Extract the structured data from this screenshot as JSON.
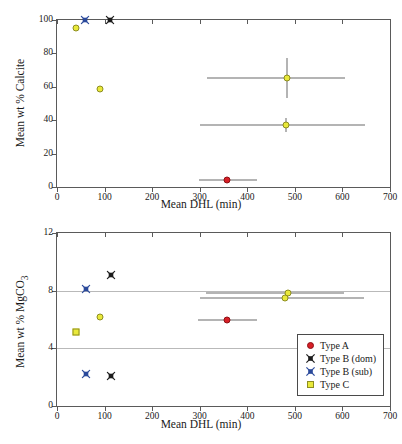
{
  "figure": {
    "panels": [
      "calcite-panel",
      "mgco3-panel"
    ]
  },
  "chart_data": [
    {
      "id": "calcite",
      "type": "scatter",
      "title": "",
      "xlabel": "Mean DHL (min)",
      "ylabel": "Mean wt % Calcite",
      "xlim": [
        0,
        700
      ],
      "ylim": [
        0,
        100
      ],
      "xticks": [
        0,
        100,
        200,
        300,
        400,
        500,
        600,
        700
      ],
      "yticks": [
        0,
        20,
        40,
        60,
        80,
        100
      ],
      "xticklabels": [
        "0",
        "100",
        "200",
        "300",
        "400",
        "500",
        "600",
        "700"
      ],
      "yticklabels": [
        "0",
        "20",
        "40",
        "60",
        "80",
        "100"
      ],
      "grid": false,
      "frame": "box",
      "legend": null,
      "series": [
        {
          "name": "Type A",
          "marker": "circle",
          "color": "#d81f26",
          "points": [
            {
              "x": 358,
              "y": 4.0,
              "xerr_low": 298,
              "xerr_high": 420
            }
          ]
        },
        {
          "name": "Type B (dom)",
          "marker": "x-dark",
          "color": "#1c1c1c",
          "points": [
            {
              "x": 112,
              "y": 100.0
            }
          ]
        },
        {
          "name": "Type B (sub)",
          "marker": "x-blue",
          "color": "#2b4a9b",
          "points": [
            {
              "x": 58,
              "y": 100.0
            }
          ]
        },
        {
          "name": "Type C",
          "marker": "circle",
          "color": "#e9e93a",
          "points": [
            {
              "x": 40,
              "y": 95.2
            },
            {
              "x": 90,
              "y": 58.4
            },
            {
              "x": 483,
              "y": 65.5,
              "xerr_low": 316,
              "xerr_high": 606,
              "yerr_low": 53.5,
              "yerr_high": 77.5
            },
            {
              "x": 481,
              "y": 37.4,
              "xerr_low": 300,
              "xerr_high": 648,
              "yerr_low": 33.0,
              "yerr_high": 41.5
            }
          ]
        }
      ]
    },
    {
      "id": "mgco3",
      "type": "scatter",
      "title": "",
      "xlabel": "Mean DHL (min)",
      "ylabel": "Mean wt % MgCO3",
      "ylabel_display": "Mean wt % MgCO",
      "ylabel_subscript": "3",
      "xlim": [
        0,
        700
      ],
      "ylim": [
        0,
        12
      ],
      "xticks": [
        0,
        100,
        200,
        300,
        400,
        500,
        600,
        700
      ],
      "yticks": [
        0,
        4,
        8,
        12
      ],
      "xticklabels": [
        "0",
        "100",
        "200",
        "300",
        "400",
        "500",
        "600",
        "700"
      ],
      "yticklabels": [
        "0",
        "4",
        "8",
        "12"
      ],
      "gridlines_y": [
        4,
        8
      ],
      "grid": true,
      "frame": "box",
      "legend": {
        "position": "lower-right",
        "entries": [
          {
            "label": "Type A",
            "marker": "circle",
            "color": "#d81f26"
          },
          {
            "label": "Type B (dom)",
            "marker": "x-dark",
            "color": "#1c1c1c"
          },
          {
            "label": "Type B (sub)",
            "marker": "x-blue",
            "color": "#2b4a9b"
          },
          {
            "label": "Type C",
            "marker": "square",
            "color": "#e9e93a"
          }
        ]
      },
      "series": [
        {
          "name": "Type A",
          "marker": "circle",
          "color": "#d81f26",
          "points": [
            {
              "x": 358,
              "y": 5.98,
              "xerr_low": 297,
              "xerr_high": 421
            }
          ]
        },
        {
          "name": "Type B (dom)",
          "marker": "x-dark",
          "color": "#1c1c1c",
          "points": [
            {
              "x": 113,
              "y": 9.1
            },
            {
              "x": 113,
              "y": 2.1
            }
          ]
        },
        {
          "name": "Type B (sub)",
          "marker": "x-blue",
          "color": "#2b4a9b",
          "points": [
            {
              "x": 60,
              "y": 8.1
            },
            {
              "x": 60,
              "y": 2.2
            }
          ]
        },
        {
          "name": "Type C",
          "marker": "square",
          "color": "#e9e93a",
          "points": [
            {
              "x": 40,
              "y": 5.1
            }
          ]
        },
        {
          "name": "Type C (circle)",
          "marker": "circle",
          "color": "#e9e93a",
          "points": [
            {
              "x": 90,
              "y": 6.2
            },
            {
              "x": 486,
              "y": 7.85,
              "xerr_low": 313,
              "xerr_high": 604
            },
            {
              "x": 480,
              "y": 7.5,
              "xerr_low": 300,
              "xerr_high": 645
            }
          ]
        }
      ]
    }
  ]
}
